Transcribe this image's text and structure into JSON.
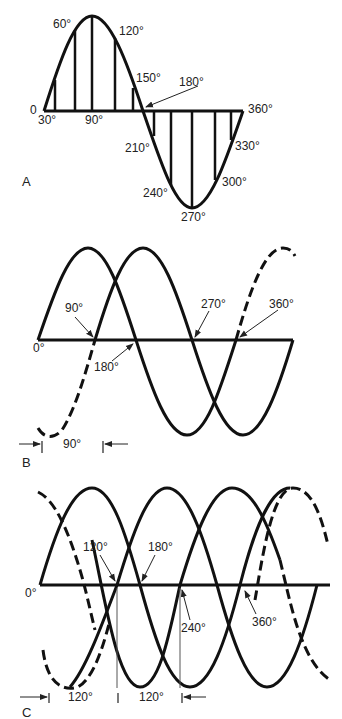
{
  "panels": {
    "A": {
      "label": "A",
      "labels": {
        "zero": "0",
        "d30": "30°",
        "d60": "60°",
        "d90": "90°",
        "d120": "120°",
        "d150": "150°",
        "d180": "180°",
        "d210": "210°",
        "d240": "240°",
        "d270": "270°",
        "d300": "300°",
        "d330": "330°",
        "d360": "360°"
      }
    },
    "B": {
      "label": "B",
      "labels": {
        "zero": "0°",
        "d90": "90°",
        "d180": "180°",
        "d270": "270°",
        "d360": "360°",
        "phase_shift": "90°"
      }
    },
    "C": {
      "label": "C",
      "labels": {
        "zero": "0°",
        "d120": "120°",
        "d180": "180°",
        "d240": "240°",
        "d360": "360°",
        "phase_shift_1": "120°",
        "phase_shift_2": "120°"
      }
    }
  }
}
